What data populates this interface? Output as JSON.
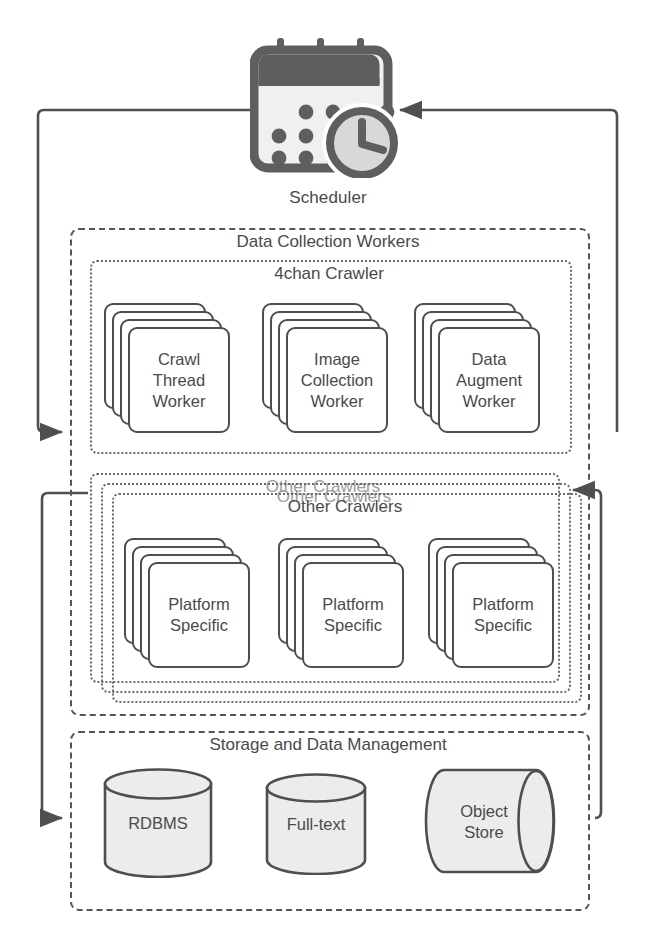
{
  "diagram": {
    "type": "block-diagram",
    "colors": {
      "stroke": "#4f4f4f",
      "text": "#4a4a4a",
      "dashed_group": "#555555",
      "dotted_group": "#6b6b6b",
      "icon_dark": "#5e5e5e",
      "icon_light": "#e8e8e8",
      "cylinder_fill": "#ececec",
      "ghost_text": "#9c9c9c",
      "background": "#ffffff"
    }
  },
  "scheduler": {
    "label": "Scheduler",
    "icon": "calendar-clock-icon"
  },
  "data_collection_workers": {
    "title": "Data Collection Workers",
    "crawler_4chan": {
      "title": "4chan Crawler",
      "workers": [
        {
          "lines": [
            "Crawl",
            "Thread",
            "Worker"
          ],
          "stack_count": 4
        },
        {
          "lines": [
            "Image",
            "Collection",
            "Worker"
          ],
          "stack_count": 4
        },
        {
          "lines": [
            "Data",
            "Augment",
            "Worker"
          ],
          "stack_count": 4
        }
      ]
    },
    "other_crawlers": {
      "title": "Other Crawlers",
      "stacked_box_count": 3,
      "ghost_titles": [
        "Other Crawlers",
        "Other Crawlers"
      ],
      "workers": [
        {
          "lines": [
            "Platform",
            "Specific"
          ],
          "stack_count": 4
        },
        {
          "lines": [
            "Platform",
            "Specific"
          ],
          "stack_count": 4
        },
        {
          "lines": [
            "Platform",
            "Specific"
          ],
          "stack_count": 4
        }
      ]
    }
  },
  "storage": {
    "title": "Storage and Data Management",
    "stores": [
      {
        "lines": [
          "RDBMS"
        ],
        "shape": "vertical-cylinder"
      },
      {
        "lines": [
          "Full-text"
        ],
        "shape": "vertical-cylinder"
      },
      {
        "lines": [
          "Object",
          "Store"
        ],
        "shape": "horizontal-cylinder"
      }
    ]
  },
  "connectors": [
    {
      "name": "scheduler-to-4chan-crawler",
      "from": "scheduler",
      "to": "4chan-crawler",
      "direction": "left-loop",
      "arrow": "right"
    },
    {
      "name": "scheduler-to-storage",
      "from": "scheduler",
      "to": "storage",
      "direction": "left-loop",
      "arrow": "right"
    },
    {
      "name": "scheduler-feedback-right",
      "from": "other-crawlers",
      "to": "scheduler",
      "direction": "right-loop",
      "arrow": "left"
    },
    {
      "name": "storage-to-other-crawlers",
      "from": "storage",
      "to": "other-crawlers",
      "direction": "right-loop",
      "arrow": "left"
    }
  ]
}
